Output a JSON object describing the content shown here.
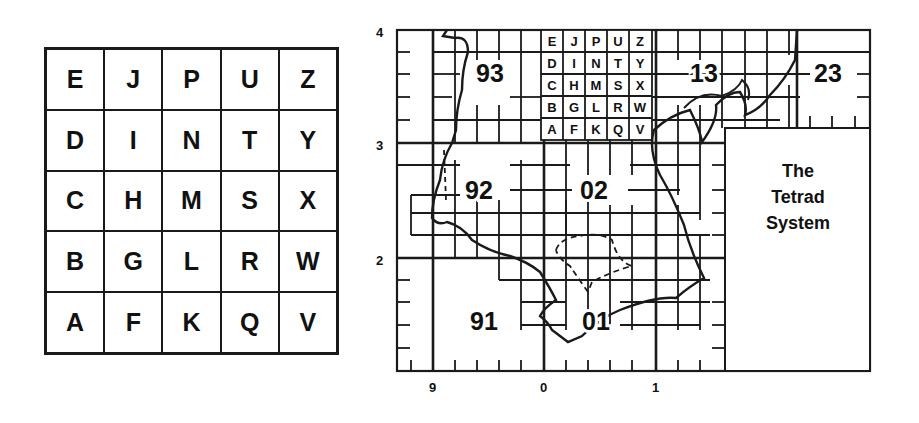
{
  "tetrad_key": {
    "rows": [
      [
        "E",
        "J",
        "P",
        "U",
        "Z"
      ],
      [
        "D",
        "I",
        "N",
        "T",
        "Y"
      ],
      [
        "C",
        "H",
        "M",
        "S",
        "X"
      ],
      [
        "B",
        "G",
        "L",
        "R",
        "W"
      ],
      [
        "A",
        "F",
        "K",
        "Q",
        "V"
      ]
    ]
  },
  "map": {
    "y_axis_labels": [
      "4",
      "3",
      "2"
    ],
    "x_axis_labels": [
      "9",
      "0",
      "1"
    ],
    "square_labels": [
      "93",
      "13",
      "23",
      "92",
      "02",
      "91",
      "01"
    ],
    "inset_title_lines": [
      "The",
      "Tetrad",
      "System"
    ],
    "mini_key_rows": [
      [
        "E",
        "J",
        "P",
        "U",
        "Z"
      ],
      [
        "D",
        "I",
        "N",
        "T",
        "Y"
      ],
      [
        "C",
        "H",
        "M",
        "S",
        "X"
      ],
      [
        "B",
        "G",
        "L",
        "R",
        "W"
      ],
      [
        "A",
        "F",
        "K",
        "Q",
        "V"
      ]
    ]
  },
  "colors": {
    "ink": "#111111",
    "paper": "#ffffff"
  }
}
